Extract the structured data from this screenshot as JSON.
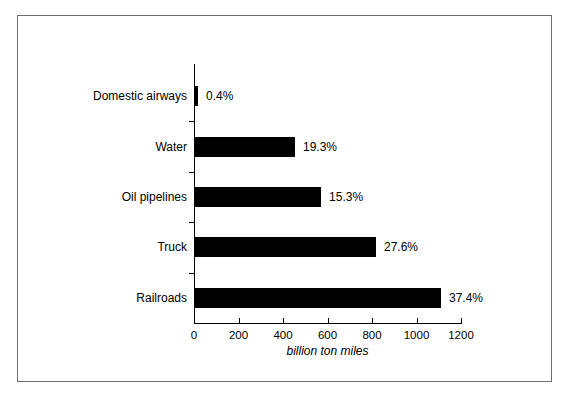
{
  "chart_data": {
    "type": "bar",
    "orientation": "horizontal",
    "title": "",
    "xlabel": "billion ton miles",
    "ylabel": "",
    "xlim": [
      0,
      1200
    ],
    "xticks": [
      0,
      200,
      400,
      600,
      800,
      1000,
      1200
    ],
    "xticklabels": [
      "0",
      "200",
      "400",
      "600",
      "800",
      "1000",
      "1200"
    ],
    "grid": false,
    "legend": null,
    "bar_color": "#000000",
    "axis_color": "#000000",
    "categories": [
      "Domestic airways",
      "Water",
      "Oil pipelines",
      "Truck",
      "Railroads"
    ],
    "values": [
      5,
      454,
      571,
      818,
      1110
    ],
    "data_labels": [
      "0.4%",
      "19.3%",
      "15.3%",
      "27.6%",
      "37.4%"
    ],
    "points": [
      {
        "category": "Domestic airways",
        "value": 5,
        "label": "0.4%"
      },
      {
        "category": "Water",
        "value": 454,
        "label": "19.3%"
      },
      {
        "category": "Oil pipelines",
        "value": 571,
        "label": "15.3%"
      },
      {
        "category": "Truck",
        "value": 818,
        "label": "27.6%"
      },
      {
        "category": "Railroads",
        "value": 1110,
        "label": "37.4%"
      }
    ]
  },
  "figure": {
    "border_color": "#6e6e6e",
    "background": "#ffffff"
  }
}
